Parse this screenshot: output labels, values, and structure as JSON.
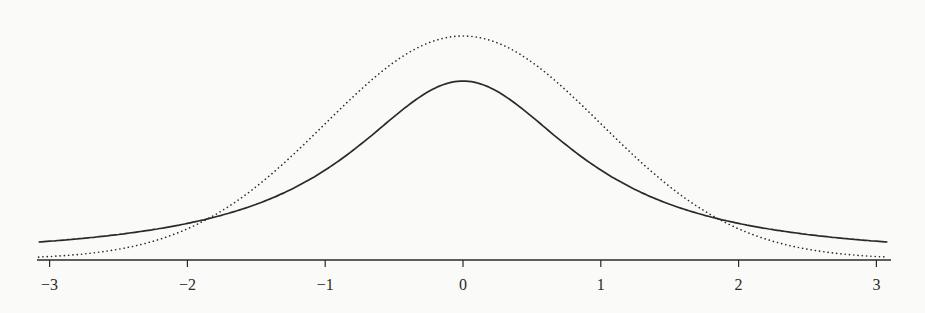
{
  "page": {
    "background": "#fafaf8",
    "ink_color": "#2a2a2a"
  },
  "chart_data": {
    "type": "line",
    "title": "",
    "xlabel": "",
    "ylabel": "",
    "xlim": [
      -3.1,
      3.1
    ],
    "ylim": [
      0,
      0.42
    ],
    "grid": false,
    "legend": null,
    "x_ticks": [
      -3,
      -2,
      -1,
      0,
      1,
      2,
      3
    ],
    "x_tick_labels": [
      "−3",
      "−2",
      "−1",
      "0",
      "1",
      "2",
      "3"
    ],
    "y_axis_visible": false,
    "series": [
      {
        "name": "standard normal density",
        "style": "dotted",
        "x": [
          -3,
          -2.5,
          -2,
          -1.5,
          -1,
          -0.5,
          0,
          0.5,
          1,
          1.5,
          2,
          2.5,
          3
        ],
        "values": [
          0.0044,
          0.0175,
          0.054,
          0.1295,
          0.242,
          0.3521,
          0.3989,
          0.3521,
          0.242,
          0.1295,
          0.054,
          0.0175,
          0.0044
        ]
      },
      {
        "name": "heavy-tailed (Cauchy-like) density",
        "style": "solid",
        "x": [
          -3,
          -2.5,
          -2,
          -1.5,
          -1,
          -0.5,
          0,
          0.5,
          1,
          1.5,
          2,
          2.5,
          3
        ],
        "values": [
          0.0318,
          0.0439,
          0.0637,
          0.0979,
          0.1592,
          0.2546,
          0.3183,
          0.2546,
          0.1592,
          0.0979,
          0.0637,
          0.0439,
          0.0318
        ]
      }
    ]
  }
}
